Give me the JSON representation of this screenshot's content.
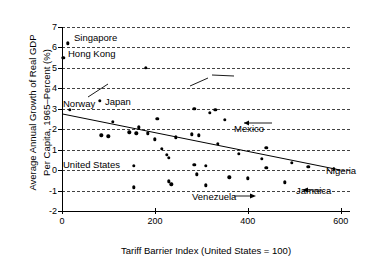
{
  "chart_data": {
    "type": "scatter",
    "title": "",
    "xlabel": "Tariff Barrier Index (United States = 100)",
    "ylabel_line1": "Average Annual Growth of Real GDP",
    "ylabel_line2": "Per Capita, 1965–Percent (%)",
    "xlim": [
      0,
      620
    ],
    "ylim": [
      -2,
      7
    ],
    "xticks": [
      0,
      200,
      400,
      600
    ],
    "xtick_labels": [
      "0",
      "200",
      "400",
      "600"
    ],
    "yticks": [
      -2,
      -1,
      0,
      1,
      2,
      3,
      4,
      5,
      6,
      7
    ],
    "ytick_labels": [
      "-2",
      "-1",
      "0",
      "1",
      "2",
      "3",
      "4",
      "5",
      "6",
      "7"
    ],
    "grid": "horizontal-dashed",
    "legend": "none",
    "points": [
      {
        "x": 12,
        "y": 6.2,
        "label": "Singapore"
      },
      {
        "x": 3,
        "y": 5.5,
        "label": "Hong Kong"
      },
      {
        "x": 180,
        "y": 5.0,
        "label": ""
      },
      {
        "x": 82,
        "y": 3.4,
        "label": "Japan"
      },
      {
        "x": 17,
        "y": 2.95,
        "label": "Norway"
      },
      {
        "x": 285,
        "y": 3.0,
        "label": ""
      },
      {
        "x": 330,
        "y": 2.95,
        "label": ""
      },
      {
        "x": 318,
        "y": 2.8,
        "label": ""
      },
      {
        "x": 110,
        "y": 2.35,
        "label": ""
      },
      {
        "x": 350,
        "y": 2.45,
        "label": ""
      },
      {
        "x": 165,
        "y": 2.1,
        "label": ""
      },
      {
        "x": 205,
        "y": 2.5,
        "label": ""
      },
      {
        "x": 145,
        "y": 1.85,
        "label": ""
      },
      {
        "x": 160,
        "y": 1.8,
        "label": ""
      },
      {
        "x": 185,
        "y": 1.8,
        "label": ""
      },
      {
        "x": 85,
        "y": 1.7,
        "label": ""
      },
      {
        "x": 100,
        "y": 1.65,
        "label": "United States"
      },
      {
        "x": 280,
        "y": 1.75,
        "label": ""
      },
      {
        "x": 295,
        "y": 1.7,
        "label": "Mexico"
      },
      {
        "x": 200,
        "y": 1.5,
        "label": ""
      },
      {
        "x": 245,
        "y": 1.6,
        "label": ""
      },
      {
        "x": 335,
        "y": 1.3,
        "label": ""
      },
      {
        "x": 440,
        "y": 1.1,
        "label": ""
      },
      {
        "x": 215,
        "y": 1.05,
        "label": ""
      },
      {
        "x": 225,
        "y": 0.75,
        "label": ""
      },
      {
        "x": 230,
        "y": 0.6,
        "label": ""
      },
      {
        "x": 380,
        "y": 0.8,
        "label": ""
      },
      {
        "x": 155,
        "y": 0.2,
        "label": ""
      },
      {
        "x": 430,
        "y": 0.55,
        "label": ""
      },
      {
        "x": 495,
        "y": 0.35,
        "label": ""
      },
      {
        "x": 530,
        "y": 0.15,
        "label": ""
      },
      {
        "x": 585,
        "y": 0.05,
        "label": "Nigeria"
      },
      {
        "x": 285,
        "y": 0.25,
        "label": ""
      },
      {
        "x": 310,
        "y": 0.2,
        "label": ""
      },
      {
        "x": 440,
        "y": 0.1,
        "label": ""
      },
      {
        "x": 290,
        "y": -0.2,
        "label": ""
      },
      {
        "x": 360,
        "y": -0.35,
        "label": ""
      },
      {
        "x": 400,
        "y": -0.4,
        "label": "Venezuela"
      },
      {
        "x": 230,
        "y": -0.55,
        "label": ""
      },
      {
        "x": 235,
        "y": -0.7,
        "label": ""
      },
      {
        "x": 310,
        "y": -0.75,
        "label": ""
      },
      {
        "x": 155,
        "y": -0.85,
        "label": ""
      },
      {
        "x": 480,
        "y": -0.6,
        "label": "Jamaica"
      }
    ],
    "trend_line": {
      "x0": 0,
      "y0": 2.75,
      "x1": 600,
      "y1": 0.0
    }
  },
  "annotations": {
    "singapore": "Singapore",
    "hong_kong": "Hong Kong",
    "norway": "Norway",
    "japan": "Japan",
    "mexico": "Mexico",
    "united_states": "United States",
    "venezuela": "Venezuela",
    "nigeria": "Nigeria",
    "jamaica": "Jamaica"
  },
  "colors": {
    "point": "#000000",
    "grid": "#222222",
    "axis": "#000000",
    "background": "#ffffff"
  }
}
